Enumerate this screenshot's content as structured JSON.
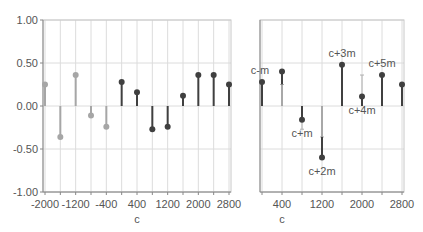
{
  "chart_data": [
    {
      "type": "stem",
      "title": "",
      "xlabel": "c",
      "ylabel": "",
      "xlim": [
        -2000,
        2800
      ],
      "ylim": [
        -1.0,
        1.0
      ],
      "x_ticks": [
        -2000,
        -1200,
        -400,
        400,
        1200,
        2000,
        2800
      ],
      "x_tick_labels": [
        "-2000",
        "-1200",
        "-400",
        "400",
        "1200",
        "2000",
        "2800"
      ],
      "y_ticks": [
        -1.0,
        -0.5,
        0.0,
        0.5,
        1.0
      ],
      "y_tick_labels": [
        "-1.00",
        "-0.50",
        "0.00",
        "0.50",
        "1.00"
      ],
      "grid": true,
      "series": [
        {
          "name": "negative-lag",
          "color": "#a6a6a6",
          "x": [
            -2000,
            -1600,
            -1200,
            -800,
            -400
          ],
          "values": [
            0.25,
            -0.36,
            0.36,
            -0.11,
            -0.24
          ]
        },
        {
          "name": "positive-lag",
          "color": "#404040",
          "x": [
            0,
            400,
            800,
            1200,
            1600,
            2000,
            2400,
            2800
          ],
          "values": [
            0.28,
            0.16,
            -0.27,
            -0.24,
            0.12,
            0.36,
            0.36,
            0.25
          ]
        }
      ]
    },
    {
      "type": "stem",
      "title": "",
      "xlabel": "c",
      "ylabel": "",
      "xlim": [
        0,
        2800
      ],
      "ylim": [
        -1.0,
        1.0
      ],
      "x_ticks": [
        400,
        1200,
        2000,
        2800
      ],
      "x_tick_labels": [
        "400",
        "1200",
        "2000",
        "2800"
      ],
      "y_ticks": [
        -1.0,
        -0.5,
        0.0,
        0.5,
        1.0
      ],
      "grid": true,
      "series": [
        {
          "name": "shifted",
          "color": "#404040",
          "ghost_color": "#b0b0b0",
          "x": [
            0,
            400,
            800,
            1200,
            1600,
            2000,
            2400,
            2800
          ],
          "values": [
            0.28,
            0.4,
            -0.16,
            -0.6,
            0.48,
            0.11,
            0.36,
            0.25
          ],
          "previous": [
            0.28,
            0.25,
            -0.27,
            -0.36,
            0.48,
            0.36,
            0.36,
            0.25
          ]
        }
      ],
      "annotations": [
        {
          "text": "c-m",
          "x": 0,
          "y": 0.28,
          "pos": "above"
        },
        {
          "text": "c+m",
          "x": 800,
          "y": -0.16,
          "pos": "below"
        },
        {
          "text": "c+2m",
          "x": 1200,
          "y": -0.6,
          "pos": "below"
        },
        {
          "text": "c+3m",
          "x": 1600,
          "y": 0.48,
          "pos": "above"
        },
        {
          "text": "c+4m",
          "x": 2000,
          "y": 0.11,
          "pos": "below"
        },
        {
          "text": "c+5m",
          "x": 2400,
          "y": 0.36,
          "pos": "above"
        }
      ]
    }
  ]
}
